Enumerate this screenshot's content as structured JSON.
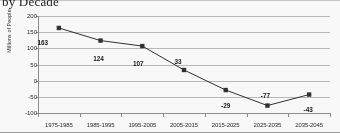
{
  "chart_data": {
    "type": "line",
    "title": "by Decade",
    "xlabel": "",
    "ylabel": "Millions of People",
    "categories": [
      "1975-1985",
      "1985-1995",
      "1995-2005",
      "2005-2015",
      "2015-2025",
      "2025-2035",
      "2035-2045"
    ],
    "values": [
      163,
      124,
      107,
      33,
      -29,
      -77,
      -43
    ],
    "data_labels": [
      "163",
      "124",
      "107",
      "33",
      "-29",
      "-77",
      "-43"
    ],
    "ylim": [
      -100,
      200
    ],
    "yticks": [
      200,
      150,
      100,
      50,
      0,
      -50,
      -100
    ],
    "ytick_labels": [
      "200",
      "150",
      "100",
      "50",
      "0",
      "-50",
      "-100"
    ],
    "grid": true,
    "legend": "none",
    "series_color": "#2b2b2b",
    "marker": "square",
    "gridline_color": "#b9b9b9"
  }
}
